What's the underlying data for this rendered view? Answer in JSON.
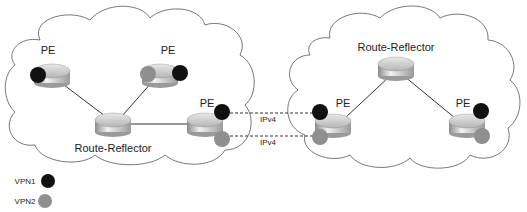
{
  "diagram": {
    "colors": {
      "vpn1": "#111111",
      "vpn2": "#8f8f8f",
      "cloud_stroke": "#555555",
      "link": "#333333"
    },
    "left_cloud": {
      "routers": [
        {
          "id": "pe1",
          "label": "PE",
          "x": 52,
          "y": 75
        },
        {
          "id": "pe2",
          "label": "PE",
          "x": 160,
          "y": 75
        },
        {
          "id": "rr1",
          "label": "Route-Reflector",
          "x": 113,
          "y": 124
        },
        {
          "id": "pe3",
          "label": "PE",
          "x": 205,
          "y": 124
        }
      ]
    },
    "right_cloud": {
      "routers": [
        {
          "id": "rr2",
          "label": "Route-Reflector",
          "x": 396,
          "y": 68
        },
        {
          "id": "pe4",
          "label": "PE",
          "x": 333,
          "y": 125
        },
        {
          "id": "pe5",
          "label": "PE",
          "x": 467,
          "y": 125
        }
      ]
    },
    "inter_links": [
      {
        "label": "IPv4",
        "vpn": "VPN1"
      },
      {
        "label": "IPv4",
        "vpn": "VPN2"
      }
    ],
    "legend": [
      {
        "label": "VPN1",
        "color": "#111111"
      },
      {
        "label": "VPN2",
        "color": "#8f8f8f"
      }
    ]
  }
}
